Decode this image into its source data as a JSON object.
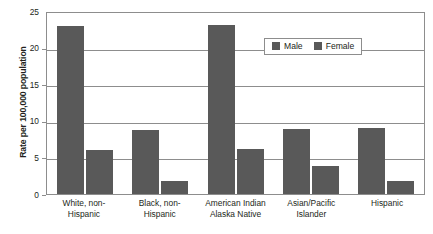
{
  "chart_data": {
    "type": "bar",
    "title": "",
    "xlabel": "",
    "ylabel": "Rate per 100,000 population",
    "ylim": [
      0,
      25
    ],
    "ytick_labels": [
      "0",
      "5",
      "10",
      "15",
      "20",
      "25"
    ],
    "ytick_values": [
      0,
      5,
      10,
      15,
      20,
      25
    ],
    "grid": true,
    "legend_position": "upper-right-inside",
    "categories": [
      "White, non-Hispanic",
      "Black, non-Hispanic",
      "American Indian/Alaska Native",
      "Asian/Pacific Islander",
      "Hispanic"
    ],
    "category_lines": [
      [
        "White, non-",
        "Hispanic"
      ],
      [
        "Black, non-",
        "Hispanic"
      ],
      [
        "American Indian",
        "Alaska Native"
      ],
      [
        "Asian/Pacific",
        "Islander"
      ],
      [
        "Hispanic"
      ]
    ],
    "series": [
      {
        "name": "Male",
        "values": [
          22.9,
          8.8,
          23.1,
          8.9,
          9.0
        ]
      },
      {
        "name": "Female",
        "values": [
          6.0,
          1.8,
          6.1,
          3.8,
          1.8
        ]
      }
    ],
    "colors": {
      "male_bar": "#595959",
      "female_bar": "#595959",
      "gridline": "#8d8d8d",
      "axis": "#8d8d8d",
      "text": "#231f20",
      "background": "#ffffff"
    }
  },
  "legend": {
    "items": [
      {
        "label": "Male"
      },
      {
        "label": "Female"
      }
    ]
  }
}
